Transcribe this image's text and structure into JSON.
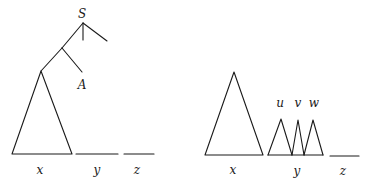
{
  "left_tree": {
    "root_label": "S",
    "node_label": "A",
    "segment_labels": [
      "x",
      "y",
      "z"
    ]
  },
  "right_tree": {
    "subtree_labels": [
      "u",
      "v",
      "w"
    ],
    "segment_labels": [
      "x",
      "y",
      "z"
    ]
  }
}
